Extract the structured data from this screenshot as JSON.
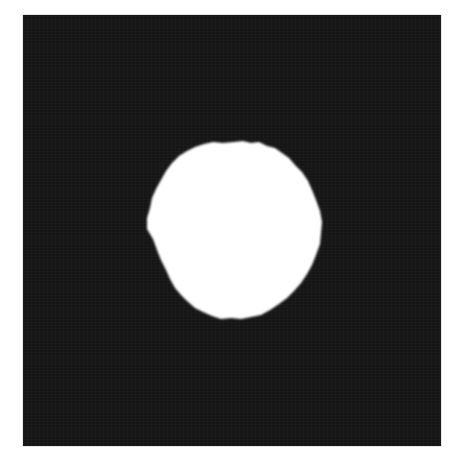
{
  "image": {
    "description": "Binary segmentation mask: a white roughly circular blob on a black square background",
    "background_color": "#151515",
    "foreground_color": "#ffffff",
    "frame": {
      "x": 23,
      "y": 15,
      "width": 418,
      "height": 431
    },
    "blob": {
      "center_x": 234,
      "center_y": 230,
      "width": 175,
      "height": 178,
      "shape": "irregular-circle"
    }
  }
}
